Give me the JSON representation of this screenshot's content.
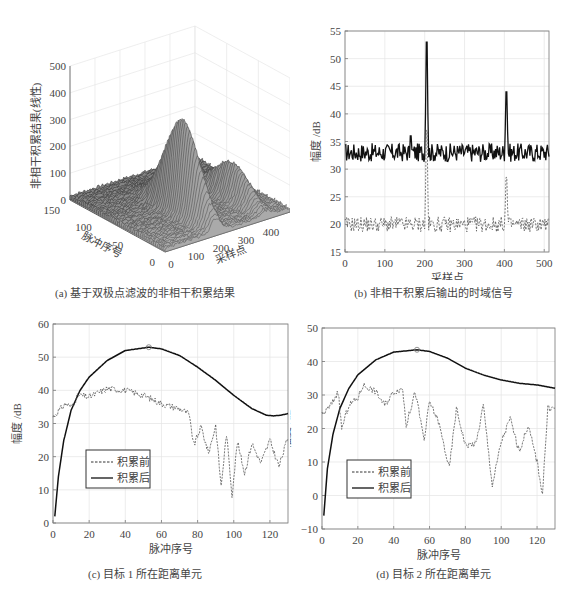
{
  "chart_data": [
    {
      "id": "a",
      "type": "surface3d",
      "caption": "(a) 基于双极点滤波的非相干积累结果",
      "zlabel": "非相干积累结果(线性)",
      "xlabel": "采样点",
      "ylabel": "脉冲序号",
      "zticks": [
        "0",
        "100",
        "200",
        "300",
        "400",
        "500"
      ],
      "xticks": [
        "0",
        "100",
        "200",
        "300",
        "400"
      ],
      "yticks": [
        "0",
        "50",
        "100",
        "150"
      ],
      "zlim": [
        0,
        500
      ],
      "peaks": [
        {
          "sample": 205,
          "pulse": 53,
          "value": 350
        },
        {
          "sample": 405,
          "pulse": 53,
          "value": 130
        }
      ]
    },
    {
      "id": "b",
      "type": "line",
      "caption": "(b) 非相干积累后输出的时域信号",
      "xlabel": "采样点",
      "ylabel": "幅度 /dB",
      "xlim": [
        0,
        512
      ],
      "ylim": [
        15,
        55
      ],
      "xticks": [
        "0",
        "100",
        "200",
        "300",
        "400",
        "500"
      ],
      "yticks": [
        "15",
        "20",
        "25",
        "30",
        "35",
        "40",
        "45",
        "50",
        "55"
      ],
      "grid": true,
      "series": [
        {
          "name": "积累后",
          "style": "solid",
          "baseline": 33,
          "noise": 1.2,
          "peaks": [
            {
              "x": 205,
              "y": 53
            },
            {
              "x": 405,
              "y": 44
            },
            {
              "x": 165,
              "y": 36
            }
          ]
        },
        {
          "name": "积累前",
          "style": "dashed",
          "baseline": 20,
          "noise": 1.0,
          "peaks": [
            {
              "x": 205,
              "y": 37
            },
            {
              "x": 405,
              "y": 28.5
            }
          ]
        }
      ]
    },
    {
      "id": "c",
      "type": "line",
      "caption": "(c) 目标 1 所在距离单元",
      "xlabel": "脉冲序号",
      "ylabel": "幅度 /dB",
      "xlim": [
        0,
        130
      ],
      "ylim": [
        0,
        60
      ],
      "xticks": [
        "0",
        "20",
        "40",
        "60",
        "80",
        "100",
        "120"
      ],
      "yticks": [
        "0",
        "10",
        "20",
        "30",
        "40",
        "50",
        "60"
      ],
      "grid": true,
      "legend": [
        "积累前",
        "积累后"
      ],
      "marker": {
        "x": 53,
        "y": 53
      },
      "series": [
        {
          "name": "积累后",
          "style": "solid",
          "x": [
            1,
            3,
            6,
            10,
            15,
            20,
            30,
            40,
            53,
            60,
            70,
            80,
            90,
            100,
            110,
            118,
            122,
            126,
            130
          ],
          "y": [
            2,
            14,
            25,
            34,
            40,
            44,
            49,
            52,
            53,
            52.5,
            50.5,
            47,
            43,
            38.5,
            34.5,
            32.5,
            32.3,
            32.5,
            33
          ]
        },
        {
          "name": "积累前",
          "style": "dashed",
          "x": [
            0,
            7,
            10,
            14,
            20,
            30,
            40,
            50,
            60,
            70,
            75,
            78,
            82,
            86,
            90,
            93,
            96,
            99,
            102,
            106,
            110,
            115,
            120,
            125,
            130
          ],
          "y": [
            32,
            36,
            35,
            38.5,
            38,
            40.5,
            40,
            38.5,
            36,
            34.5,
            33,
            23.5,
            29,
            21,
            29.5,
            11,
            27,
            8.5,
            24.5,
            15,
            24,
            18,
            25,
            17,
            26
          ]
        }
      ]
    },
    {
      "id": "d",
      "type": "line",
      "caption": "(d) 目标 2 所在距离单元",
      "xlabel": "脉冲序号",
      "ylabel": "幅度 /dB",
      "xlim": [
        0,
        130
      ],
      "ylim": [
        -10,
        50
      ],
      "xticks": [
        "0",
        "20",
        "40",
        "60",
        "80",
        "100",
        "120"
      ],
      "yticks": [
        "-10",
        "0",
        "10",
        "20",
        "30",
        "40",
        "50"
      ],
      "grid": true,
      "legend": [
        "积累前",
        "积累后"
      ],
      "marker": {
        "x": 53,
        "y": 43.5
      },
      "series": [
        {
          "name": "积累后",
          "style": "solid",
          "x": [
            1,
            3,
            6,
            10,
            15,
            20,
            30,
            40,
            53,
            60,
            70,
            80,
            90,
            100,
            110,
            120,
            130
          ],
          "y": [
            -6,
            8,
            18,
            26,
            32,
            36,
            40.5,
            42.8,
            43.5,
            43,
            41,
            38,
            36,
            34.5,
            33.5,
            33,
            32
          ]
        },
        {
          "name": "积累前",
          "style": "dashed",
          "x": [
            0,
            5,
            9,
            11,
            15,
            20,
            23,
            30,
            35,
            40,
            45,
            47,
            52,
            57,
            60,
            65,
            71,
            75,
            80,
            86,
            90,
            95,
            100,
            105,
            110,
            115,
            120,
            123,
            126,
            130
          ],
          "y": [
            24,
            27,
            31,
            20,
            27,
            29,
            33,
            31,
            27,
            31,
            32,
            21,
            31,
            16.5,
            28,
            22,
            8,
            26,
            15,
            15.5,
            27,
            3,
            16,
            23,
            13,
            21,
            10,
            0.5,
            26,
            26
          ]
        }
      ]
    }
  ]
}
